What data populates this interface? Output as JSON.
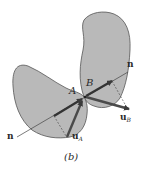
{
  "figure": {
    "caption": "(b)",
    "colors": {
      "body_fill": "#b9b9b9",
      "body_stroke": "#555555",
      "vector": "#3a3a3a",
      "line": "#444444"
    },
    "bodies": [
      {
        "name": "body-A",
        "label": "A"
      },
      {
        "name": "body-B",
        "label": "B"
      }
    ],
    "normal_line": {
      "label_start": "n",
      "label_end": "n"
    },
    "vectors": [
      {
        "name": "u_A",
        "base": "u",
        "subscript": "A"
      },
      {
        "name": "u_B",
        "base": "u",
        "subscript": "B"
      }
    ]
  }
}
